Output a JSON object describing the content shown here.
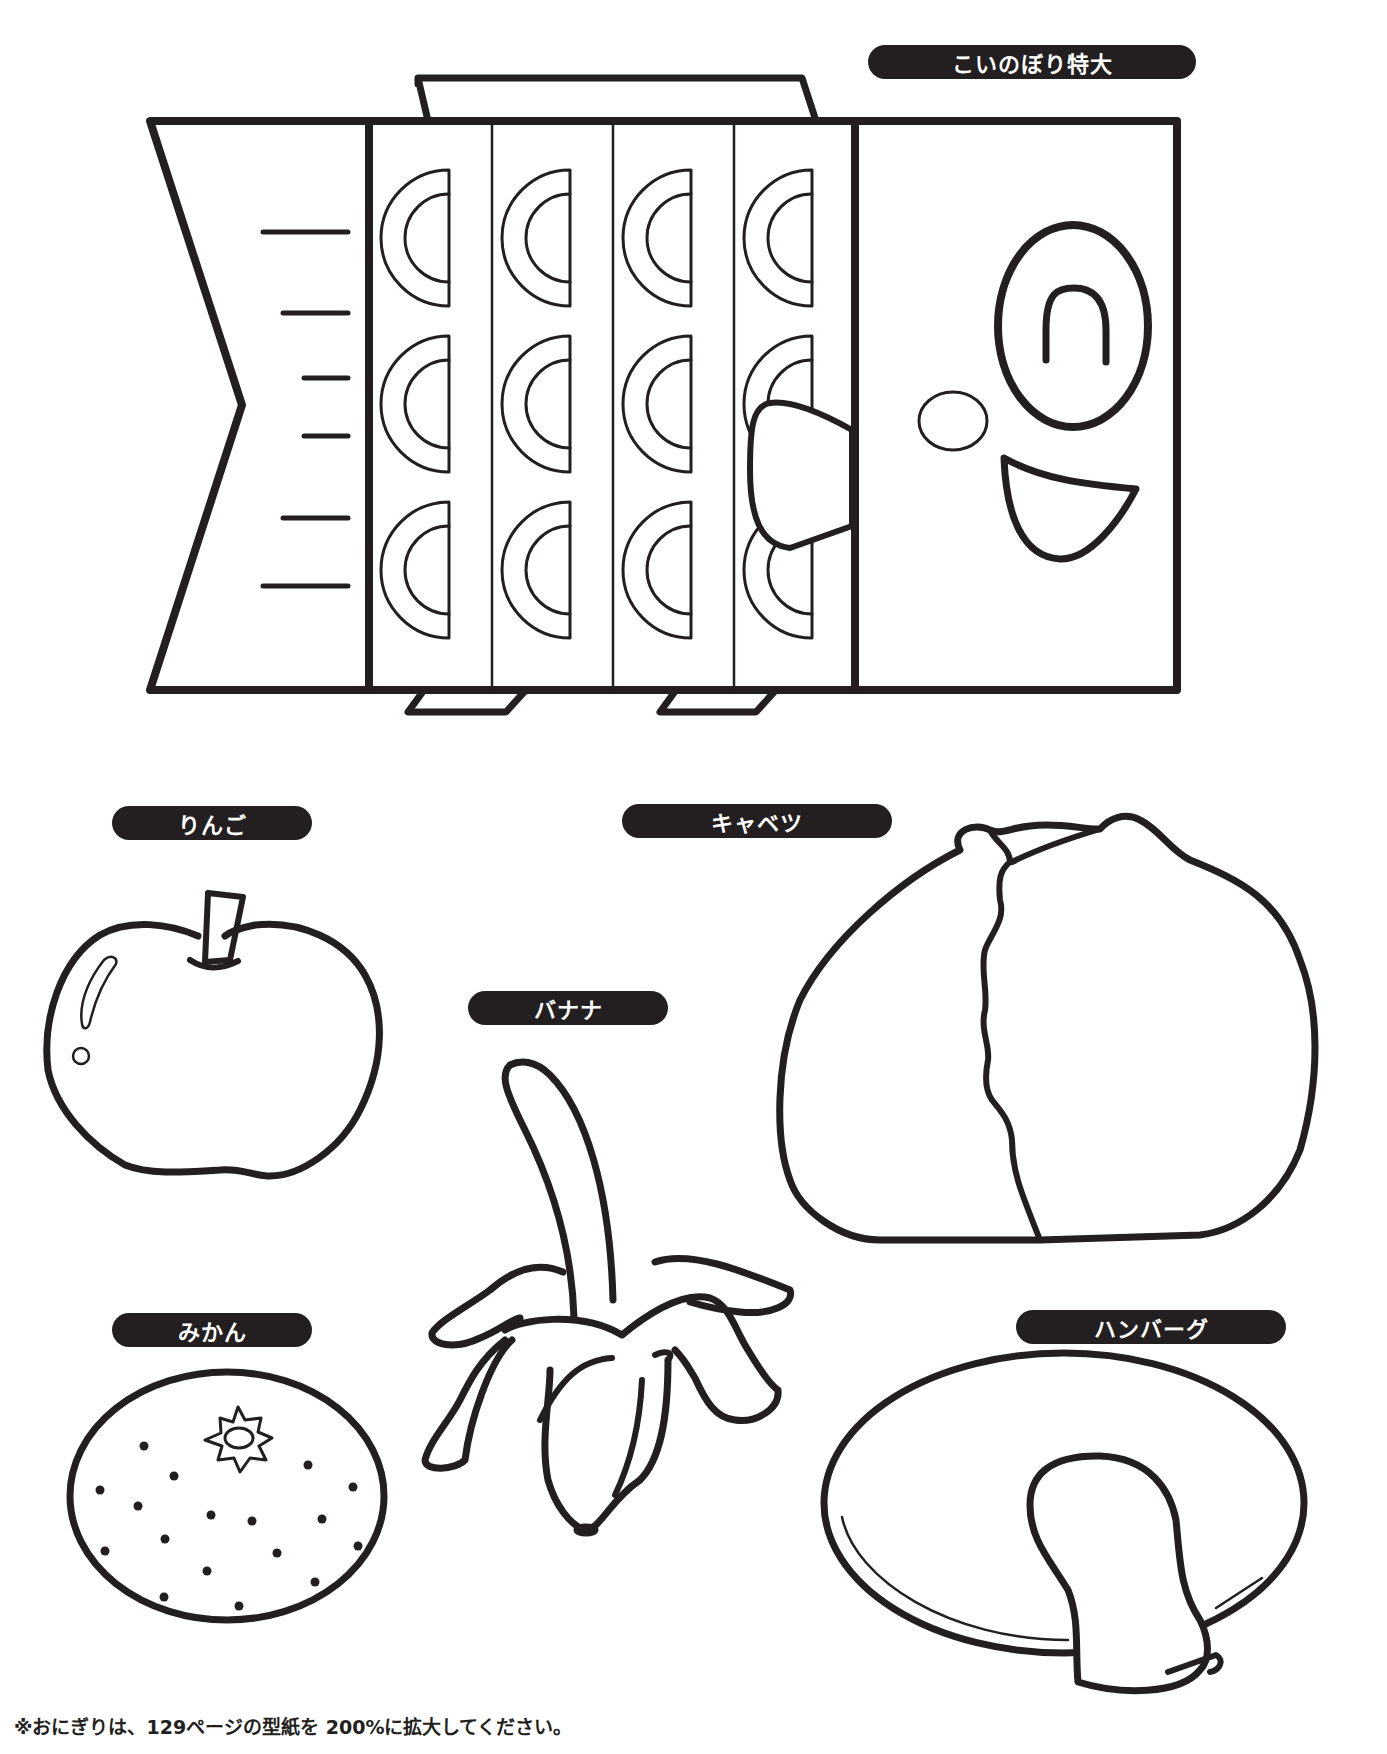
{
  "page": {
    "background": "#ffffff",
    "ink_color": "#231f20"
  },
  "labels": {
    "koinobori": "こいのぼり特大",
    "apple": "りんご",
    "cabbage": "キャベツ",
    "banana": "バナナ",
    "mikan": "みかん",
    "hamburg": "ハンバーグ"
  },
  "templates": [
    {
      "name": "koinobori",
      "label": "こいのぼり特大",
      "scales_rows": 3,
      "scales_columns": 4,
      "tail_lines": 6
    },
    {
      "name": "apple",
      "label": "りんご"
    },
    {
      "name": "cabbage",
      "label": "キャベツ"
    },
    {
      "name": "banana",
      "label": "バナナ"
    },
    {
      "name": "mikan",
      "label": "みかん",
      "dots": 18
    },
    {
      "name": "hamburg",
      "label": "ハンバーグ"
    }
  ],
  "footnote": "※おにぎりは、129ページの型紙を 200%に拡大してください。"
}
